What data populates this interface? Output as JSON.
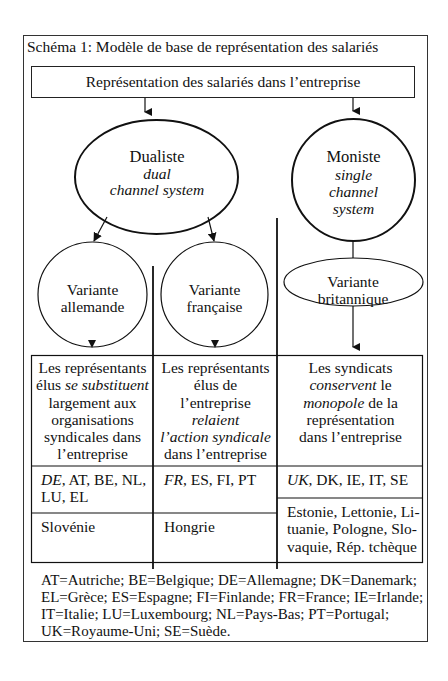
{
  "diagram": {
    "title": "Schéma 1: Modèle de base de représentation des salariés",
    "root": "Représentation des salariés dans l’entreprise",
    "dualiste": {
      "label": "Dualiste",
      "subtitle_line1": "dual",
      "subtitle_line2": "channel system"
    },
    "moniste": {
      "label": "Moniste",
      "subtitle_line1": "single",
      "subtitle_line2": "channel",
      "subtitle_line3": "system"
    },
    "variants": {
      "allemande": {
        "line1": "Variante",
        "line2": "allemande"
      },
      "francaise": {
        "line1": "Variante",
        "line2": "française"
      },
      "britannique": {
        "line1": "Variante",
        "line2": "britannique"
      }
    },
    "table": {
      "descriptions": {
        "allemande": {
          "l1": "Les représentants",
          "l2_pre": "élus ",
          "l2_em": "se substituent",
          "l3": "largement aux",
          "l4": "organisations",
          "l5": "syndicales dans",
          "l6": "l’entreprise"
        },
        "francaise": {
          "l1": "Les représentants",
          "l2": "élus de",
          "l3": "l’entreprise",
          "l4_em": "relaient",
          "l5_em": "l’action syndicale",
          "l6": "dans l’entreprise"
        },
        "britannique": {
          "l1": "Les syndicats",
          "l2_em": "conservent",
          "l2_post": " le",
          "l3_em": "monopole",
          "l3_post": " de la",
          "l4": "représentation",
          "l5": "dans l’entreprise"
        }
      },
      "countries_eu15": {
        "allemande": {
          "lead": "DE",
          "rest_line1": ", AT, BE, NL,",
          "line2": "LU, EL"
        },
        "francaise": {
          "lead": "FR",
          "rest": ", ES, FI, PT"
        },
        "britannique": {
          "lead": "UK",
          "rest": ", DK, IE, IT, SE"
        }
      },
      "countries_new": {
        "allemande": "Slovénie",
        "francaise": "Hongrie",
        "britannique": {
          "line1": "Estonie, Lettonie, Li-",
          "line2": "tuanie, Pologne, Slo-",
          "line3": "vaquie, Rép. tchèque"
        }
      }
    },
    "legend": {
      "line1": "AT=Autriche; BE=Belgique; DE=Allemagne; DK=Danemark;",
      "line2": "EL=Grèce; ES=Espagne; FI=Finlande; FR=France; IE=Irlande;",
      "line3": "IT=Italie; LU=Luxembourg; NL=Pays-Bas; PT=Portugal;",
      "line4": "UK=Royaume-Uni; SE=Suède."
    }
  }
}
